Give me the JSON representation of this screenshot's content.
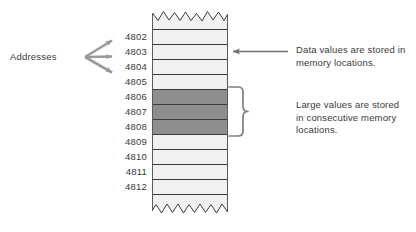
{
  "figure": {
    "addresses_group_label": "Addresses",
    "addresses": [
      "4802",
      "4803",
      "4804",
      "4805",
      "4806",
      "4807",
      "4808",
      "4809",
      "4810",
      "4811",
      "4812"
    ],
    "highlighted_addresses": [
      "4806",
      "4807",
      "4808"
    ],
    "annotations": [
      {
        "id": "data-values",
        "lines": [
          "Data values are stored in",
          "memory locations."
        ],
        "connector": "arrow-left",
        "target_address": "4803"
      },
      {
        "id": "large-values",
        "lines": [
          "Large values are stored",
          "in consecutive memory",
          "locations."
        ],
        "connector": "curly-brace",
        "target_addresses": [
          "4806",
          "4807",
          "4808"
        ]
      }
    ],
    "colors": {
      "background": "#ffffff",
      "cell_light": "#f1f1f1",
      "cell_dark": "#8e8e8e",
      "cell_border": "#3c3c3c",
      "column_outline": "#5a5a5a",
      "connector": "#808080",
      "text": "#3a3a3a"
    },
    "icons": {
      "fan_arrows": "three-arrows-fan-icon",
      "left_arrow": "arrow-left-icon",
      "brace": "curly-brace-icon",
      "torn_top": "torn-edge-icon",
      "torn_bottom": "torn-edge-icon"
    }
  }
}
